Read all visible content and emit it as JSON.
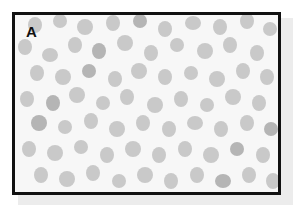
{
  "figure": {
    "panel_label": "A",
    "colors": {
      "cell": "#c9c9c9",
      "cell_dark": "#b5b5b5",
      "background": "#f7f7f7",
      "border": "#111111"
    },
    "cells": [
      [
        20,
        10,
        7,
        8
      ],
      [
        45,
        6,
        7,
        7
      ],
      [
        70,
        12,
        8,
        8
      ],
      [
        98,
        8,
        7,
        8
      ],
      [
        125,
        6,
        7,
        7
      ],
      [
        150,
        14,
        7,
        8
      ],
      [
        178,
        8,
        8,
        7
      ],
      [
        205,
        12,
        7,
        8
      ],
      [
        232,
        6,
        7,
        8
      ],
      [
        255,
        14,
        7,
        7
      ],
      [
        10,
        32,
        7,
        8
      ],
      [
        35,
        40,
        8,
        7
      ],
      [
        60,
        30,
        7,
        8
      ],
      [
        84,
        36,
        7,
        8
      ],
      [
        110,
        28,
        8,
        8
      ],
      [
        136,
        38,
        7,
        8
      ],
      [
        162,
        30,
        7,
        7
      ],
      [
        190,
        36,
        8,
        8
      ],
      [
        215,
        30,
        7,
        8
      ],
      [
        242,
        38,
        7,
        8
      ],
      [
        22,
        58,
        7,
        8
      ],
      [
        48,
        62,
        8,
        8
      ],
      [
        74,
        56,
        7,
        7
      ],
      [
        100,
        64,
        7,
        8
      ],
      [
        124,
        56,
        8,
        8
      ],
      [
        150,
        62,
        7,
        8
      ],
      [
        176,
        58,
        7,
        7
      ],
      [
        202,
        64,
        8,
        8
      ],
      [
        228,
        56,
        7,
        8
      ],
      [
        252,
        62,
        7,
        8
      ],
      [
        12,
        84,
        7,
        8
      ],
      [
        38,
        88,
        7,
        8
      ],
      [
        62,
        80,
        8,
        8
      ],
      [
        88,
        88,
        7,
        7
      ],
      [
        112,
        82,
        7,
        8
      ],
      [
        140,
        90,
        8,
        8
      ],
      [
        166,
        84,
        7,
        8
      ],
      [
        192,
        90,
        7,
        7
      ],
      [
        218,
        82,
        8,
        8
      ],
      [
        244,
        88,
        7,
        8
      ],
      [
        24,
        108,
        8,
        8
      ],
      [
        50,
        112,
        7,
        7
      ],
      [
        76,
        106,
        7,
        8
      ],
      [
        102,
        114,
        8,
        8
      ],
      [
        128,
        108,
        7,
        8
      ],
      [
        154,
        114,
        7,
        8
      ],
      [
        180,
        108,
        8,
        7
      ],
      [
        206,
        114,
        7,
        8
      ],
      [
        232,
        108,
        7,
        8
      ],
      [
        256,
        114,
        7,
        7
      ],
      [
        14,
        134,
        7,
        8
      ],
      [
        40,
        138,
        8,
        8
      ],
      [
        66,
        132,
        7,
        7
      ],
      [
        92,
        140,
        7,
        8
      ],
      [
        118,
        134,
        8,
        8
      ],
      [
        144,
        140,
        7,
        8
      ],
      [
        170,
        134,
        7,
        8
      ],
      [
        196,
        140,
        8,
        8
      ],
      [
        222,
        134,
        7,
        7
      ],
      [
        248,
        140,
        7,
        8
      ],
      [
        26,
        160,
        7,
        8
      ],
      [
        52,
        164,
        8,
        8
      ],
      [
        78,
        158,
        7,
        8
      ],
      [
        104,
        166,
        7,
        7
      ],
      [
        130,
        160,
        8,
        8
      ],
      [
        156,
        166,
        7,
        8
      ],
      [
        182,
        160,
        7,
        8
      ],
      [
        208,
        166,
        8,
        7
      ],
      [
        234,
        160,
        7,
        8
      ],
      [
        258,
        166,
        7,
        8
      ]
    ]
  }
}
